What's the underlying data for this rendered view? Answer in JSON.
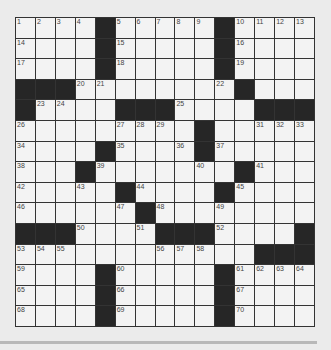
{
  "puzzle": {
    "rows": 15,
    "cols": 15,
    "grid": [
      "....#.....#....",
      "....#.....#....",
      "....#.....#....",
      "###........#...",
      "#....###....###",
      ".........#.....",
      "....#....#.....",
      "...#.......#...",
      ".....#....#....",
      "......#........",
      "###....###....#",
      "............###",
      "....#.....#....",
      "....#.....#....",
      "....#.....#...."
    ],
    "numbers": [
      {
        "r": 0,
        "c": 0,
        "n": "1"
      },
      {
        "r": 0,
        "c": 1,
        "n": "2"
      },
      {
        "r": 0,
        "c": 2,
        "n": "3"
      },
      {
        "r": 0,
        "c": 3,
        "n": "4"
      },
      {
        "r": 0,
        "c": 5,
        "n": "5"
      },
      {
        "r": 0,
        "c": 6,
        "n": "6"
      },
      {
        "r": 0,
        "c": 7,
        "n": "7"
      },
      {
        "r": 0,
        "c": 8,
        "n": "8"
      },
      {
        "r": 0,
        "c": 9,
        "n": "9"
      },
      {
        "r": 0,
        "c": 11,
        "n": "10"
      },
      {
        "r": 0,
        "c": 12,
        "n": "11"
      },
      {
        "r": 0,
        "c": 13,
        "n": "12"
      },
      {
        "r": 0,
        "c": 14,
        "n": "13"
      },
      {
        "r": 1,
        "c": 0,
        "n": "14"
      },
      {
        "r": 1,
        "c": 5,
        "n": "15"
      },
      {
        "r": 1,
        "c": 11,
        "n": "16"
      },
      {
        "r": 2,
        "c": 0,
        "n": "17"
      },
      {
        "r": 2,
        "c": 5,
        "n": "18"
      },
      {
        "r": 2,
        "c": 11,
        "n": "19"
      },
      {
        "r": 3,
        "c": 3,
        "n": "20"
      },
      {
        "r": 3,
        "c": 4,
        "n": "21"
      },
      {
        "r": 3,
        "c": 10,
        "n": "22"
      },
      {
        "r": 4,
        "c": 1,
        "n": "23"
      },
      {
        "r": 4,
        "c": 2,
        "n": "24"
      },
      {
        "r": 4,
        "c": 8,
        "n": "25"
      },
      {
        "r": 5,
        "c": 0,
        "n": "26"
      },
      {
        "r": 5,
        "c": 5,
        "n": "27"
      },
      {
        "r": 5,
        "c": 6,
        "n": "28"
      },
      {
        "r": 5,
        "c": 7,
        "n": "29"
      },
      {
        "r": 5,
        "c": 9,
        "n": "30"
      },
      {
        "r": 5,
        "c": 12,
        "n": "31"
      },
      {
        "r": 5,
        "c": 13,
        "n": "32"
      },
      {
        "r": 5,
        "c": 14,
        "n": "33"
      },
      {
        "r": 6,
        "c": 0,
        "n": "34"
      },
      {
        "r": 6,
        "c": 5,
        "n": "35"
      },
      {
        "r": 6,
        "c": 8,
        "n": "36"
      },
      {
        "r": 6,
        "c": 10,
        "n": "37"
      },
      {
        "r": 7,
        "c": 0,
        "n": "38"
      },
      {
        "r": 7,
        "c": 4,
        "n": "39"
      },
      {
        "r": 7,
        "c": 9,
        "n": "40"
      },
      {
        "r": 7,
        "c": 12,
        "n": "41"
      },
      {
        "r": 8,
        "c": 0,
        "n": "42"
      },
      {
        "r": 8,
        "c": 3,
        "n": "43"
      },
      {
        "r": 8,
        "c": 6,
        "n": "44"
      },
      {
        "r": 8,
        "c": 11,
        "n": "45"
      },
      {
        "r": 9,
        "c": 0,
        "n": "46"
      },
      {
        "r": 9,
        "c": 5,
        "n": "47"
      },
      {
        "r": 9,
        "c": 7,
        "n": "48"
      },
      {
        "r": 9,
        "c": 10,
        "n": "49"
      },
      {
        "r": 10,
        "c": 3,
        "n": "50"
      },
      {
        "r": 10,
        "c": 6,
        "n": "51"
      },
      {
        "r": 10,
        "c": 10,
        "n": "52"
      },
      {
        "r": 11,
        "c": 0,
        "n": "53"
      },
      {
        "r": 11,
        "c": 1,
        "n": "54"
      },
      {
        "r": 11,
        "c": 2,
        "n": "55"
      },
      {
        "r": 11,
        "c": 7,
        "n": "56"
      },
      {
        "r": 11,
        "c": 8,
        "n": "57"
      },
      {
        "r": 11,
        "c": 9,
        "n": "58"
      },
      {
        "r": 12,
        "c": 0,
        "n": "59"
      },
      {
        "r": 12,
        "c": 5,
        "n": "60"
      },
      {
        "r": 12,
        "c": 11,
        "n": "61"
      },
      {
        "r": 12,
        "c": 12,
        "n": "62"
      },
      {
        "r": 12,
        "c": 13,
        "n": "63"
      },
      {
        "r": 12,
        "c": 14,
        "n": "64"
      },
      {
        "r": 13,
        "c": 0,
        "n": "65"
      },
      {
        "r": 13,
        "c": 5,
        "n": "66"
      },
      {
        "r": 13,
        "c": 11,
        "n": "67"
      },
      {
        "r": 14,
        "c": 0,
        "n": "68"
      },
      {
        "r": 14,
        "c": 5,
        "n": "69"
      },
      {
        "r": 14,
        "c": 11,
        "n": "70"
      }
    ]
  }
}
